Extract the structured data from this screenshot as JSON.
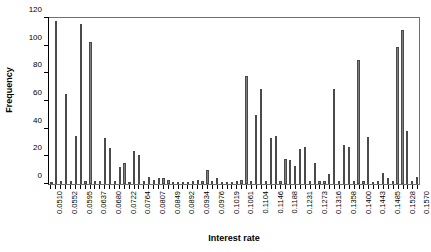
{
  "chart_data": {
    "type": "bar",
    "title": "",
    "xlabel": "Interest rate",
    "ylabel": "Frequency",
    "ylim": [
      0,
      120
    ],
    "yticks": [
      0,
      20,
      40,
      60,
      80,
      100,
      120
    ],
    "grid": false,
    "legend": null,
    "label_every": 3,
    "categories": [
      "0.0510",
      "0.0524",
      "0.0538",
      "0.0552",
      "0.0566",
      "0.0581",
      "0.0595",
      "0.0609",
      "0.0623",
      "0.0637",
      "0.0651",
      "0.0665",
      "0.0680",
      "0.0694",
      "0.0708",
      "0.0722",
      "0.0736",
      "0.0750",
      "0.0764",
      "0.0779",
      "0.0793",
      "0.0807",
      "0.0821",
      "0.0835",
      "0.0849",
      "0.0863",
      "0.0878",
      "0.0892",
      "0.0906",
      "0.0920",
      "0.0934",
      "0.0948",
      "0.0962",
      "0.0976",
      "0.0991",
      "0.1005",
      "0.1019",
      "0.1033",
      "0.1047",
      "0.1061",
      "0.1075",
      "0.1090",
      "0.1104",
      "0.1118",
      "0.1132",
      "0.1146",
      "0.1160",
      "0.1174",
      "0.1188",
      "0.1202",
      "0.1217",
      "0.1231",
      "0.1245",
      "0.1259",
      "0.1273",
      "0.1287",
      "0.1301",
      "0.1316",
      "0.1330",
      "0.1344",
      "0.1358",
      "0.1372",
      "0.1386",
      "0.1400",
      "0.1415",
      "0.1429",
      "0.1443",
      "0.1457",
      "0.1471",
      "0.1485",
      "0.1499",
      "0.1513",
      "0.1528",
      "0.1542",
      "0.1556",
      "0.1570"
    ],
    "tick_labels": [
      "0.0510",
      "0.0552",
      "0.0595",
      "0.0637",
      "0.0680",
      "0.0722",
      "0.0764",
      "0.0807",
      "0.0849",
      "0.0892",
      "0.0934",
      "0.0976",
      "0.1019",
      "0.1061",
      "0.1104",
      "0.1146",
      "0.1188",
      "0.1231",
      "0.1273",
      "0.1316",
      "0.1358",
      "0.1400",
      "0.1443",
      "0.1485",
      "0.1528",
      "0.1570"
    ],
    "values": [
      1,
      118,
      2,
      65,
      2,
      35,
      116,
      2,
      103,
      2,
      2,
      33,
      26,
      2,
      12,
      15,
      1,
      24,
      21,
      2,
      5,
      3,
      4,
      4,
      3,
      1,
      1,
      1,
      1,
      2,
      3,
      2,
      10,
      2,
      4,
      1,
      1,
      1,
      2,
      3,
      78,
      2,
      50,
      69,
      2,
      33,
      35,
      2,
      18,
      17,
      13,
      25,
      27,
      2,
      15,
      2,
      2,
      7,
      69,
      2,
      28,
      27,
      2,
      90,
      2,
      34,
      1,
      2,
      8,
      4,
      2,
      99,
      111,
      38,
      2,
      5
    ]
  }
}
